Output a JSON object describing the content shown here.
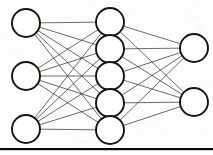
{
  "figure": {
    "background_color": "#fdfdfc",
    "node_fill": "#ffffff",
    "node_stroke": "#141414",
    "edge_color": "#3a3a3a",
    "rule_color": "#0a0a0a"
  },
  "chart_data": {
    "type": "diagram",
    "title": "",
    "xlabel": "",
    "ylabel": "",
    "grid": false,
    "legend": false,
    "layers": [
      {
        "name": "input-layer",
        "index": 0,
        "node_count": 3,
        "cx": 26,
        "radius": 14,
        "nodes": [
          {
            "id": "i1",
            "cx": 26,
            "cy": 23,
            "r": 14
          },
          {
            "id": "i2",
            "cx": 26,
            "cy": 76,
            "r": 14
          },
          {
            "id": "i3",
            "cx": 26,
            "cy": 129,
            "r": 14
          }
        ]
      },
      {
        "name": "hidden-layer",
        "index": 1,
        "node_count": 5,
        "cx": 110,
        "radius": 14,
        "nodes": [
          {
            "id": "h1",
            "cx": 110,
            "cy": 22,
            "r": 14
          },
          {
            "id": "h2",
            "cx": 110,
            "cy": 49,
            "r": 14
          },
          {
            "id": "h3",
            "cx": 110,
            "cy": 76,
            "r": 14
          },
          {
            "id": "h4",
            "cx": 110,
            "cy": 103,
            "r": 14
          },
          {
            "id": "h5",
            "cx": 110,
            "cy": 130,
            "r": 14
          }
        ]
      },
      {
        "name": "output-layer",
        "index": 2,
        "node_count": 2,
        "cx": 194,
        "radius": 14,
        "nodes": [
          {
            "id": "o1",
            "cx": 194,
            "cy": 48,
            "r": 14
          },
          {
            "id": "o2",
            "cx": 194,
            "cy": 102,
            "r": 14
          }
        ]
      }
    ],
    "connections": {
      "input_to_hidden": "fully-connected",
      "hidden_to_output": "fully-connected",
      "input_to_hidden_count": 15,
      "hidden_to_output_count": 10,
      "total_edges": 25
    },
    "baseline_rule": {
      "x": 0,
      "y": 148,
      "width": 213,
      "height": 2.2
    }
  }
}
